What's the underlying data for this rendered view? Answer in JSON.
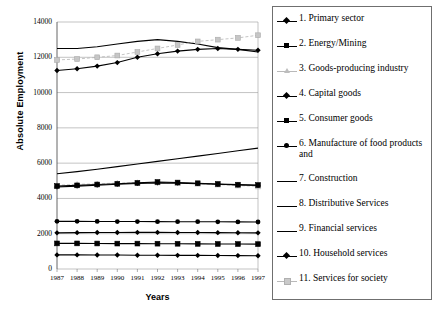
{
  "chart_data": {
    "type": "line",
    "title": "",
    "xlabel": "Years",
    "ylabel": "Absolute Employment",
    "x": [
      1987,
      1988,
      1989,
      1990,
      1991,
      1992,
      1993,
      1994,
      1995,
      1996,
      1997
    ],
    "xtick_labels": [
      "1987",
      "1988",
      "1989",
      "1990",
      "1991",
      "1992",
      "1993",
      "1994",
      "1995",
      "1996",
      "1997"
    ],
    "ytick_labels": [
      "0",
      "2000",
      "4000",
      "6000",
      "8000",
      "10000",
      "12000",
      "14000"
    ],
    "yticks": [
      0,
      2000,
      4000,
      6000,
      8000,
      10000,
      12000,
      14000
    ],
    "ylim": [
      0,
      14000
    ],
    "xlim": [
      1987,
      1997
    ],
    "grid": "horizontal",
    "legend_position": "right",
    "series": [
      {
        "name": "1. Primary sector",
        "number": 1,
        "marker": "diamond",
        "color": "#000000",
        "values": [
          800,
          800,
          790,
          790,
          780,
          780,
          775,
          770,
          765,
          760,
          755
        ]
      },
      {
        "name": "2. Energy/Mining",
        "number": 2,
        "marker": "square",
        "color": "#000000",
        "values": [
          1450,
          1450,
          1445,
          1440,
          1440,
          1435,
          1430,
          1425,
          1420,
          1415,
          1410
        ]
      },
      {
        "name": "3. Goods-producing industry",
        "number": 3,
        "marker": "triangle",
        "color": "#bdbdbd",
        "values": [
          4750,
          4800,
          4830,
          4870,
          4900,
          4900,
          4880,
          4830,
          4780,
          4730,
          4680
        ]
      },
      {
        "name": "4. Capital goods",
        "number": 4,
        "marker": "diamond",
        "color": "#000000",
        "values": [
          2050,
          2060,
          2065,
          2070,
          2075,
          2075,
          2070,
          2065,
          2060,
          2055,
          2050
        ]
      },
      {
        "name": "5. Consumer goods",
        "number": 5,
        "marker": "square",
        "color": "#000000",
        "values": [
          4700,
          4740,
          4790,
          4830,
          4880,
          4930,
          4900,
          4860,
          4820,
          4780,
          4760
        ]
      },
      {
        "name": "6. Manufacture of food products and",
        "number": 6,
        "marker": "circle",
        "color": "#000000",
        "values": [
          2700,
          2700,
          2695,
          2690,
          2690,
          2685,
          2680,
          2680,
          2675,
          2670,
          2665
        ]
      },
      {
        "name": "7. Construction",
        "number": 7,
        "marker": "plus",
        "color": "#000000",
        "values": [
          4650,
          4700,
          4750,
          4800,
          4850,
          4880,
          4870,
          4840,
          4800,
          4760,
          4730
        ]
      },
      {
        "name": "8. Distributive Services",
        "number": 8,
        "marker": "none",
        "color": "#000000",
        "values": [
          12500,
          12500,
          12600,
          12750,
          12900,
          13000,
          12900,
          12750,
          12550,
          12450,
          12300
        ]
      },
      {
        "name": "9. Financial services",
        "number": 9,
        "marker": "none",
        "color": "#000000",
        "values": [
          5400,
          5520,
          5650,
          5800,
          5950,
          6100,
          6250,
          6400,
          6550,
          6700,
          6850
        ]
      },
      {
        "name": "10. Household services",
        "number": 10,
        "marker": "diamond",
        "color": "#000000",
        "values": [
          11250,
          11350,
          11500,
          11700,
          12000,
          12200,
          12350,
          12450,
          12500,
          12450,
          12400
        ]
      },
      {
        "name": "11. Services for society",
        "number": 11,
        "marker": "square-light",
        "color": "#b5b5b5",
        "values": [
          11850,
          11900,
          12000,
          12100,
          12300,
          12500,
          12700,
          12900,
          13000,
          13100,
          13250
        ]
      }
    ]
  },
  "legend": {
    "items": [
      {
        "label": "1. Primary sector"
      },
      {
        "label": "2. Energy/Mining"
      },
      {
        "label": "3. Goods-producing industry"
      },
      {
        "label": "4. Capital goods"
      },
      {
        "label": "5. Consumer goods"
      },
      {
        "label": "6. Manufacture of food products and"
      },
      {
        "label": "7. Construction"
      },
      {
        "label": "8. Distributive Services"
      },
      {
        "label": "9. Financial services"
      },
      {
        "label": "10. Household services"
      },
      {
        "label": "11. Services for society"
      }
    ]
  }
}
